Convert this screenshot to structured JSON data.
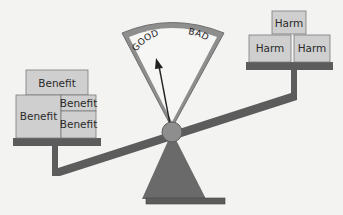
{
  "diagram": {
    "type": "balance-scale",
    "gauge": {
      "left_label": "GOOD",
      "right_label": "BAD",
      "pointer_direction": "GOOD"
    },
    "left_pan": {
      "boxes": [
        {
          "label": "Benefit"
        },
        {
          "label": "Benefit"
        },
        {
          "label": "Benefit"
        },
        {
          "label": "Benefit"
        }
      ]
    },
    "right_pan": {
      "boxes": [
        {
          "label": "Harm"
        },
        {
          "label": "Harm"
        },
        {
          "label": "Harm"
        }
      ]
    },
    "colors": {
      "background": "#f3f3f1",
      "box_fill": "#cfcfcf",
      "box_stroke": "#7a7a7a",
      "structure_dark": "#5c5c5c",
      "gauge_rim": "#8a8a8a",
      "pivot": "#8e8e8e"
    }
  }
}
